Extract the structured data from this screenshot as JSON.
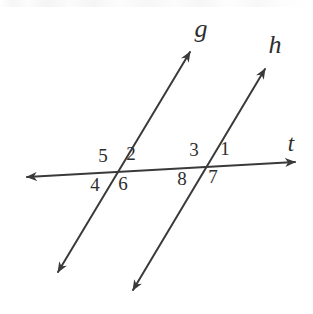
{
  "figure": {
    "kind": "geometry-diagram",
    "width": 313,
    "height": 314,
    "background_color": "#ffffff",
    "stroke_color": "#3a3a3a",
    "text_color": "#2e2e2e",
    "stroke_width": 2
  },
  "lines": [
    {
      "id": "g",
      "label": "g",
      "role": "parallel-line-left",
      "start": {
        "x": 58,
        "y": 272
      },
      "end": {
        "x": 190,
        "y": 52
      },
      "arrow_start": true,
      "arrow_end": true,
      "label_position": {
        "x": 201,
        "y": 29
      }
    },
    {
      "id": "h",
      "label": "h",
      "role": "parallel-line-right",
      "start": {
        "x": 133,
        "y": 290
      },
      "end": {
        "x": 265,
        "y": 69
      },
      "arrow_start": true,
      "arrow_end": true,
      "label_position": {
        "x": 275,
        "y": 45
      }
    },
    {
      "id": "t",
      "label": "t",
      "role": "transversal",
      "start": {
        "x": 27,
        "y": 177
      },
      "end": {
        "x": 295,
        "y": 162
      },
      "arrow_start": true,
      "arrow_end": true,
      "label_position": {
        "x": 291,
        "y": 143
      }
    }
  ],
  "intersections": [
    {
      "id": "left",
      "lines": [
        "g",
        "t"
      ],
      "x": 115,
      "y": 172
    },
    {
      "id": "right",
      "lines": [
        "h",
        "t"
      ],
      "x": 206,
      "y": 166
    }
  ],
  "angles": [
    {
      "label": "1",
      "x": 225,
      "y": 148,
      "intersection": "right",
      "quadrant": "upper-right"
    },
    {
      "label": "2",
      "x": 131,
      "y": 153,
      "intersection": "left",
      "quadrant": "upper-right"
    },
    {
      "label": "3",
      "x": 194,
      "y": 149,
      "intersection": "right",
      "quadrant": "upper-left"
    },
    {
      "label": "4",
      "x": 95,
      "y": 184,
      "intersection": "left",
      "quadrant": "lower-left"
    },
    {
      "label": "5",
      "x": 103,
      "y": 155,
      "intersection": "left",
      "quadrant": "upper-left"
    },
    {
      "label": "6",
      "x": 123,
      "y": 183,
      "intersection": "left",
      "quadrant": "lower-right"
    },
    {
      "label": "7",
      "x": 213,
      "y": 176,
      "intersection": "right",
      "quadrant": "lower-right"
    },
    {
      "label": "8",
      "x": 182,
      "y": 178,
      "intersection": "right",
      "quadrant": "lower-left"
    }
  ]
}
